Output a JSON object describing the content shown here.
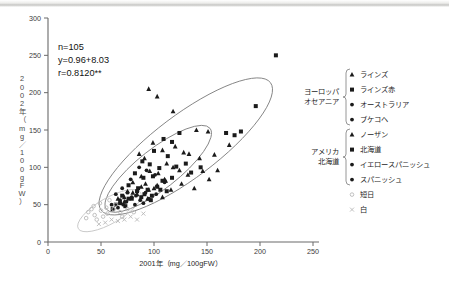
{
  "chart_data": {
    "type": "scatter",
    "title": "",
    "xlabel": "2001年（mg／100gFW）",
    "ylabel": "2002年（mg／100gFW）",
    "xlim": [
      0,
      250
    ],
    "ylim": [
      0,
      300
    ],
    "xticks": [
      0,
      50,
      100,
      150,
      200,
      250
    ],
    "yticks": [
      0,
      50,
      100,
      150,
      200,
      250,
      300
    ],
    "grid": false,
    "legend_position": "right",
    "annotations": {
      "n": "n=105",
      "equation": "y=0.96+8.03",
      "correlation": "r=0.8120**"
    },
    "series": [
      {
        "name": "ラインズ",
        "group": "ヨーロッパ・オセアニア",
        "marker": "triangle",
        "color": "#1b1b1b",
        "points": [
          [
            95,
            205
          ],
          [
            103,
            195
          ],
          [
            118,
            175
          ],
          [
            140,
            150
          ],
          [
            151,
            148
          ],
          [
            120,
            128
          ],
          [
            128,
            120
          ],
          [
            133,
            118
          ],
          [
            99,
            133
          ],
          [
            108,
            123
          ],
          [
            86,
            118
          ],
          [
            91,
            112
          ],
          [
            143,
            112
          ],
          [
            157,
            117
          ],
          [
            171,
            130
          ],
          [
            112,
            105
          ],
          [
            118,
            100
          ],
          [
            124,
            96
          ],
          [
            96,
            95
          ],
          [
            104,
            92
          ],
          [
            88,
            88
          ],
          [
            132,
            90
          ],
          [
            146,
            95
          ],
          [
            80,
            80
          ],
          [
            92,
            78
          ],
          [
            110,
            84
          ],
          [
            126,
            78
          ],
          [
            100,
            72
          ],
          [
            116,
            70
          ],
          [
            75,
            68
          ],
          [
            84,
            64
          ],
          [
            138,
            72
          ],
          [
            152,
            84
          ],
          [
            66,
            58
          ],
          [
            72,
            54
          ],
          [
            108,
            60
          ],
          [
            94,
            58
          ],
          [
            160,
            96
          ]
        ]
      },
      {
        "name": "ラインズ赤",
        "group": "ヨーロッパ・オセアニア",
        "marker": "square",
        "color": "#1b1b1b",
        "points": [
          [
            215,
            250
          ],
          [
            196,
            182
          ],
          [
            182,
            148
          ],
          [
            168,
            146
          ],
          [
            176,
            143
          ],
          [
            124,
            146
          ],
          [
            109,
            138
          ],
          [
            117,
            134
          ],
          [
            100,
            122
          ],
          [
            113,
            115
          ],
          [
            89,
            108
          ],
          [
            96,
            104
          ],
          [
            105,
            99
          ],
          [
            121,
            101
          ],
          [
            130,
            105
          ],
          [
            82,
            92
          ],
          [
            90,
            86
          ],
          [
            99,
            88
          ],
          [
            108,
            82
          ],
          [
            117,
            86
          ],
          [
            76,
            76
          ],
          [
            85,
            72
          ],
          [
            94,
            70
          ],
          [
            103,
            74
          ],
          [
            112,
            68
          ],
          [
            70,
            62
          ],
          [
            79,
            58
          ],
          [
            88,
            60
          ],
          [
            97,
            56
          ],
          [
            64,
            50
          ],
          [
            73,
            48
          ],
          [
            135,
            93
          ],
          [
            144,
            100
          ],
          [
            61,
            44
          ]
        ]
      },
      {
        "name": "オーストラリア",
        "group": "ヨーロッパ・オセアニア",
        "marker": "circle",
        "color": "#1b1b1b",
        "points": [
          [
            86,
            100
          ],
          [
            93,
            96
          ],
          [
            78,
            84
          ],
          [
            101,
            90
          ],
          [
            70,
            72
          ],
          [
            64,
            64
          ],
          [
            110,
            80
          ]
        ]
      },
      {
        "name": "ブケコヘ",
        "group": "ヨーロッパ・オセアニア",
        "marker": "circle",
        "color": "#1b1b1b",
        "points": [
          [
            75,
            66
          ],
          [
            83,
            62
          ],
          [
            92,
            66
          ],
          [
            68,
            56
          ],
          [
            60,
            50
          ]
        ]
      },
      {
        "name": "ノーザン",
        "group": "アメリカ・北海道",
        "marker": "triangle",
        "color": "#1b1b1b",
        "points": [
          [
            88,
            74
          ],
          [
            95,
            70
          ],
          [
            80,
            66
          ],
          [
            103,
            76
          ],
          [
            72,
            60
          ],
          [
            111,
            82
          ]
        ]
      },
      {
        "name": "北海道",
        "group": "アメリカ・北海道",
        "marker": "square",
        "color": "#1b1b1b",
        "points": [
          [
            84,
            68
          ],
          [
            91,
            64
          ],
          [
            98,
            62
          ],
          [
            76,
            58
          ],
          [
            106,
            70
          ],
          [
            68,
            52
          ]
        ]
      },
      {
        "name": "イエロースパニッシュ",
        "group": "アメリカ・北海道",
        "marker": "circle",
        "color": "#1b1b1b",
        "points": [
          [
            79,
            60
          ],
          [
            87,
            56
          ],
          [
            95,
            58
          ],
          [
            71,
            50
          ],
          [
            102,
            64
          ]
        ]
      },
      {
        "name": "スパニッシュ",
        "group": "アメリカ・北海道",
        "marker": "circle",
        "color": "#1b1b1b",
        "points": [
          [
            74,
            54
          ],
          [
            82,
            50
          ],
          [
            90,
            52
          ],
          [
            66,
            46
          ]
        ]
      },
      {
        "name": "短日",
        "group": "",
        "marker": "circle-light",
        "color": "#b9b9b9",
        "points": [
          [
            38,
            40
          ],
          [
            44,
            36
          ],
          [
            50,
            42
          ],
          [
            56,
            38
          ],
          [
            43,
            48
          ],
          [
            49,
            52
          ],
          [
            55,
            46
          ],
          [
            62,
            44
          ],
          [
            68,
            40
          ],
          [
            36,
            32
          ],
          [
            58,
            56
          ],
          [
            64,
            50
          ],
          [
            70,
            34
          ],
          [
            46,
            30
          ],
          [
            52,
            34
          ],
          [
            75,
            44
          ],
          [
            81,
            40
          ],
          [
            41,
            44
          ]
        ]
      },
      {
        "name": "白",
        "group": "",
        "marker": "x-light",
        "color": "#b9b9b9",
        "points": [
          [
            60,
            30
          ],
          [
            66,
            28
          ],
          [
            72,
            30
          ],
          [
            54,
            26
          ],
          [
            78,
            34
          ],
          [
            84,
            30
          ],
          [
            90,
            38
          ],
          [
            48,
            24
          ]
        ]
      }
    ],
    "ellipses": [
      {
        "name": "outer-dashed",
        "cx": 130,
        "cy": 128,
        "rx": 100,
        "ry": 42,
        "rotation": -37,
        "style": "dark"
      },
      {
        "name": "inner-solid",
        "cx": 104,
        "cy": 98,
        "rx": 62,
        "ry": 27,
        "rotation": -38,
        "style": "dark"
      },
      {
        "name": "light-cluster",
        "cx": 58,
        "cy": 42,
        "rx": 34,
        "ry": 17,
        "rotation": -30,
        "style": "light"
      }
    ]
  },
  "legend": {
    "groups": [
      {
        "label_line1": "ヨーロッパ",
        "label_line2": "オセアニア",
        "items": [
          {
            "marker": "triangle",
            "label": "ラインズ"
          },
          {
            "marker": "square",
            "label": "ラインズ赤"
          },
          {
            "marker": "circle",
            "label": "オーストラリア"
          },
          {
            "marker": "circle",
            "label": "ブケコヘ"
          }
        ]
      },
      {
        "label_line1": "アメリカ",
        "label_line2": "北海道",
        "items": [
          {
            "marker": "triangle",
            "label": "ノーザン"
          },
          {
            "marker": "square",
            "label": "北海道"
          },
          {
            "marker": "circle",
            "label": "イエロースパニッシュ"
          },
          {
            "marker": "circle",
            "label": "スパニッシュ"
          }
        ]
      }
    ],
    "standalone": [
      {
        "marker": "circle-light",
        "label": "短日"
      },
      {
        "marker": "x-light",
        "label": "白"
      }
    ]
  }
}
